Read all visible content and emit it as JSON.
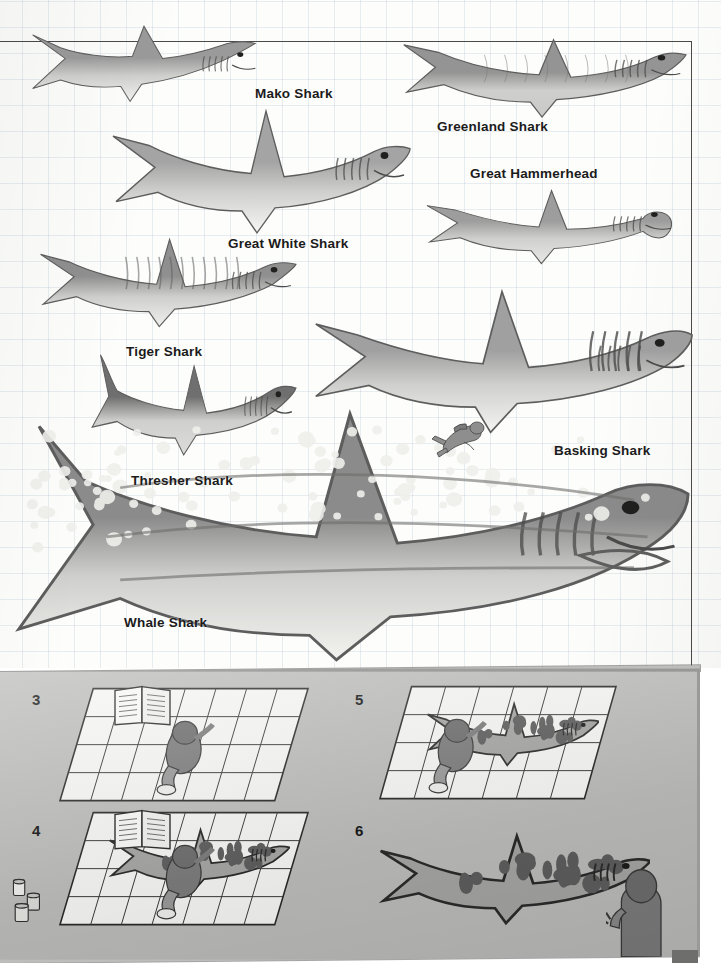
{
  "page": {
    "kind": "scanned-book-page",
    "background_color": "#fdfdfb",
    "grid_color": "#7896b4",
    "ink_color": "#1b1b1b",
    "panel_color": "#bdbdbb"
  },
  "chart_data": {
    "type": "table",
    "xlabel": "",
    "ylabel": "",
    "grid": true,
    "legend": "none",
    "categories": [
      "Mako Shark",
      "Greenland Shark",
      "Great White Shark",
      "Great Hammerhead",
      "Tiger Shark",
      "Basking Shark",
      "Thresher Shark",
      "Whale Shark"
    ],
    "values": [
      34,
      44,
      58,
      38,
      42,
      73,
      38,
      100
    ],
    "note": "Relative drawn body length of each shark as a percentage of the largest (Whale Shark); a scuba diver silhouette is included for scale."
  },
  "chart": {
    "species": [
      {
        "id": "mako",
        "label": "Mako Shark",
        "label_x": 255,
        "label_y": 86,
        "fish_x": 28,
        "fish_y": 22,
        "fish_w": 232,
        "fish_h": 88,
        "body_fill": "#9a9a9a",
        "belly_fill": "#f2f2f0",
        "flip": false
      },
      {
        "id": "greenland",
        "label": "Greenland Shark",
        "label_x": 437,
        "label_y": 119,
        "fish_x": 398,
        "fish_y": 20,
        "fish_w": 288,
        "fish_h": 102,
        "body_fill": "#949494",
        "belly_fill": "#c9c9c7",
        "flip": false
      },
      {
        "id": "great-white",
        "label": "Great White Shark",
        "label_x": 228,
        "label_y": 236,
        "fish_x": 110,
        "fish_y": 108,
        "fish_w": 300,
        "fish_h": 128,
        "body_fill": "#a4a4a4",
        "belly_fill": "#f6f6f4",
        "flip": false
      },
      {
        "id": "hammerhead",
        "label": "Great Hammerhead",
        "label_x": 470,
        "label_y": 166,
        "fish_x": 422,
        "fish_y": 182,
        "fish_w": 254,
        "fish_h": 88,
        "body_fill": "#9d9d9d",
        "belly_fill": "#e8e8e6",
        "flip": false
      },
      {
        "id": "tiger",
        "label": "Tiger Shark",
        "label_x": 126,
        "label_y": 344,
        "fish_x": 38,
        "fish_y": 232,
        "fish_w": 258,
        "fish_h": 102,
        "body_fill": "#8f8f8f",
        "belly_fill": "#efefed",
        "flip": false
      },
      {
        "id": "basking",
        "label": "Basking Shark",
        "label_x": 554,
        "label_y": 443,
        "fish_x": 312,
        "fish_y": 288,
        "fish_w": 380,
        "fish_h": 148,
        "body_fill": "#a0a0a0",
        "belly_fill": "#f4f4f2",
        "flip": false
      },
      {
        "id": "thresher",
        "label": "Thresher Shark",
        "label_x": 131,
        "label_y": 473,
        "fish_x": 88,
        "fish_y": 352,
        "fish_w": 208,
        "fish_h": 114,
        "body_fill": "#6f6f6f",
        "belly_fill": "#dcdcda",
        "flip": false
      },
      {
        "id": "whale",
        "label": "Whale Shark",
        "label_x": 124,
        "label_y": 615,
        "fish_x": 12,
        "fish_y": 414,
        "fish_w": 676,
        "fish_h": 252,
        "body_fill": "#8b8b8b",
        "belly_fill": "#f2f2ef",
        "flip": false
      }
    ],
    "diver": {
      "id": "scuba-diver",
      "label": "scuba diver scale figure",
      "x": 424,
      "y": 404,
      "w": 66,
      "h": 56
    }
  },
  "steps_panel": {
    "background_color": "#bdbdbb",
    "steps": [
      {
        "number": "3",
        "num_x": 32,
        "num_y": 22,
        "canvas_x": 58,
        "canvas_y": 18,
        "canvas_w": 252,
        "canvas_h": 116,
        "caption": "Artist kneels on gridded floor paper referring to an open book",
        "has_shark": false,
        "has_book": true,
        "has_paint_cans": false,
        "cols": 7,
        "rows": 4
      },
      {
        "number": "4",
        "num_x": 32,
        "num_y": 153,
        "canvas_x": 58,
        "canvas_y": 142,
        "canvas_w": 252,
        "canvas_h": 116,
        "caption": "Shark outline sketched on the grid; paint cans at left, artist filling in pattern",
        "has_shark": true,
        "has_book": true,
        "has_paint_cans": true,
        "cols": 7,
        "rows": 4
      },
      {
        "number": "5",
        "num_x": 355,
        "num_y": 22,
        "canvas_x": 378,
        "canvas_y": 16,
        "canvas_w": 240,
        "canvas_h": 116,
        "caption": "Artist paints the tiger-shark spots onto the large floor drawing",
        "has_shark": true,
        "has_book": false,
        "has_paint_cans": false,
        "cols": 6,
        "rows": 4
      },
      {
        "number": "6",
        "num_x": 355,
        "num_y": 153,
        "canvas_x": 374,
        "canvas_y": 150,
        "canvas_w": 296,
        "canvas_h": 120,
        "caption": "Finished spotted shark mural with the artist standing beside it",
        "has_shark": true,
        "has_book": false,
        "has_paint_cans": false,
        "cols": 0,
        "rows": 0
      }
    ],
    "standing_figure": {
      "label": "person standing at right of finished mural",
      "x": 606,
      "y": 198,
      "w": 66,
      "h": 92
    }
  }
}
